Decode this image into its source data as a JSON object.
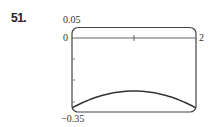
{
  "problem": {
    "number": "51."
  },
  "chart_data": {
    "type": "line",
    "title": "",
    "xlabel": "",
    "ylabel": "",
    "xlim": [
      0,
      2
    ],
    "ylim": [
      -0.35,
      0.05
    ],
    "labels": {
      "y_top": "0.05",
      "y_zero": "0",
      "x_right": "2",
      "y_bottom": "−0.35"
    },
    "x_ticks": [
      1
    ],
    "y_ticks": [
      -0.1,
      -0.2,
      -0.3
    ],
    "grid": false,
    "legend": null,
    "series": [
      {
        "name": "f(x)",
        "x": [
          0,
          0.25,
          0.5,
          0.75,
          1.0,
          1.25,
          1.5,
          1.75,
          2.0
        ],
        "y": [
          -0.331,
          -0.3,
          -0.276,
          -0.258,
          -0.251,
          -0.258,
          -0.276,
          -0.3,
          -0.331
        ]
      }
    ]
  },
  "style": {
    "frame_color": "#444444",
    "curve_color": "#333333",
    "axis_color": "#555555"
  }
}
